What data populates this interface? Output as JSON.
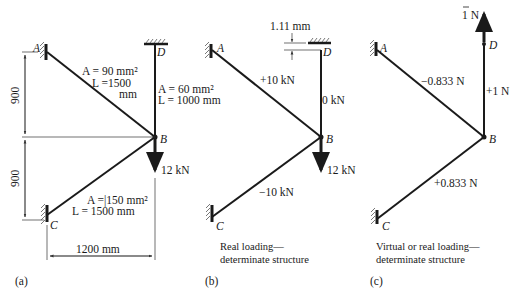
{
  "panels": {
    "a": {
      "caption": "(a)",
      "joints": {
        "A": "A",
        "B": "B",
        "C": "C",
        "D": "D"
      },
      "member_AB": {
        "area": "A = 90 mm²",
        "length_line1": "L =1500",
        "length_line2": "mm"
      },
      "member_BD": {
        "area": "A = 60 mm²",
        "length": "L = 1000 mm"
      },
      "member_BC": {
        "area": "A =|150 mm²",
        "length": "L = 1500 mm"
      },
      "load": "12 kN",
      "dim_upper": "900",
      "dim_lower": "900",
      "dim_horizontal": "1200 mm"
    },
    "b": {
      "caption": "(b)",
      "joints": {
        "A": "A",
        "B": "B",
        "C": "C",
        "D": "D"
      },
      "force_AB": "+10 kN",
      "force_BD": "0 kN",
      "force_BC": "−10 kN",
      "load": "12 kN",
      "gap": "1.11 mm",
      "description_line1": "Real loading—",
      "description_line2": "determinate structure"
    },
    "c": {
      "caption": "(c)",
      "joints": {
        "A": "A",
        "B": "B",
        "C": "C",
        "D": "D"
      },
      "force_AB": "−0.833 N",
      "force_BD": "+1 N",
      "force_BC": "+0.833 N",
      "load": "1 N",
      "description_line1": "Virtual or real loading—",
      "description_line2": "determinate structure"
    }
  }
}
